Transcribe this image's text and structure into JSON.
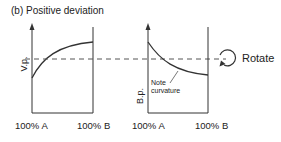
{
  "title": "(b) Positive deviation",
  "left_plot": {
    "y_label": "V.p.",
    "x_left_label": "100% A",
    "x_right_label": "100% B"
  },
  "right_plot": {
    "y_label": "B.p.",
    "x_left_label": "100% A",
    "x_right_label": "100% B",
    "annotation_line1": "Note",
    "annotation_line2": "curvature"
  },
  "rotate_label": "Rotate",
  "colors": {
    "line": "#333333",
    "dashed": "#555555"
  }
}
